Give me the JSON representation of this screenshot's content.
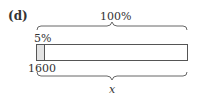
{
  "diagram": {
    "part_label": "(d)",
    "top_brace_label": "100%",
    "part_percent_label": "5%",
    "part_value_label": "1600",
    "bottom_brace_label": "x",
    "bar": {
      "shaded_fraction": 0.05,
      "shaded_color": "#e3e3e3",
      "border_color": "#555555"
    }
  }
}
